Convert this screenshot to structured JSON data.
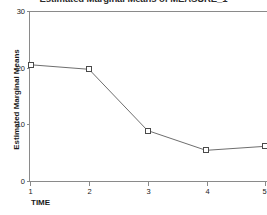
{
  "chart_data": {
    "type": "line",
    "title": "Estimated Marginal Means of MEASURE_1",
    "xlabel": "TIME",
    "ylabel": "Estimated Marginal Means",
    "categories": [
      "1",
      "2",
      "3",
      "4",
      "5"
    ],
    "x": [
      1,
      2,
      3,
      4,
      5
    ],
    "values": [
      20.6,
      19.8,
      9.0,
      5.5,
      6.2
    ],
    "series": [
      {
        "name": "MEASURE_1",
        "values": [
          20.6,
          19.8,
          9.0,
          5.5,
          6.2
        ]
      }
    ],
    "xlim": [
      1,
      5
    ],
    "ylim": [
      0,
      30
    ],
    "yticks": [
      0,
      10,
      20,
      30
    ],
    "ytick_labels": [
      "0",
      "10",
      "20",
      "30"
    ],
    "xticks": [
      1,
      2,
      3,
      4,
      5
    ],
    "xtick_labels": [
      "1",
      "2",
      "3",
      "4",
      "5"
    ],
    "grid": false,
    "legend": false,
    "marker": "open-square",
    "colors": {
      "line": "#6e6e6e",
      "marker_stroke": "#4a4a4a",
      "marker_fill": "#ffffff",
      "axis": "#8a8a8a",
      "text": "#1a1a1a",
      "background": "#ffffff"
    }
  }
}
